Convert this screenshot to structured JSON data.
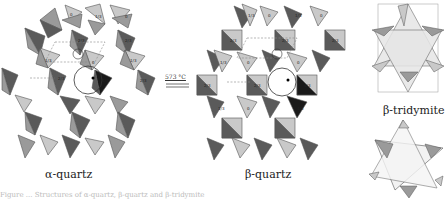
{
  "figure": {
    "panels": [
      {
        "id": "alpha-quartz",
        "label": "α-quartz"
      },
      {
        "id": "beta-quartz",
        "label": "β-quartz"
      },
      {
        "id": "beta-tridymite",
        "label": "β-tridymite"
      }
    ],
    "transition": {
      "temperature": "573 °C"
    },
    "tetrahedron_height_labels": [
      "0",
      "1/3",
      "2/3"
    ],
    "colors": {
      "light": "#c9c9c9",
      "mid": "#9a9a9a",
      "dark": "#5a5a5a",
      "black": "#1a1a1a",
      "outline": "#444444",
      "dashed": "#888888"
    },
    "caption": "Figure ... Structures of α-quartz, β-quartz and β-tridymite"
  }
}
